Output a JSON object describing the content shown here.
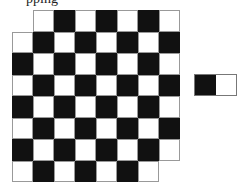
{
  "caption": "pping",
  "board": {
    "rows": 8,
    "cols": 8,
    "removed_corners": [
      "top-left",
      "bottom-right"
    ],
    "colors": {
      "dark": "#111111",
      "light": "#ffffff"
    },
    "first_cell_dark": true
  },
  "domino": {
    "squares": [
      "dark",
      "light"
    ]
  }
}
